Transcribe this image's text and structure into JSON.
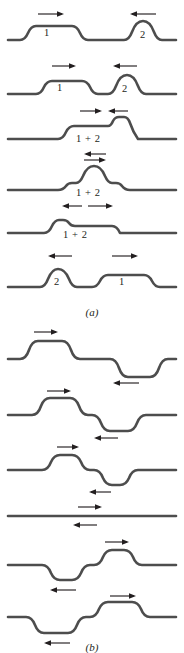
{
  "figure": {
    "panels": [
      {
        "id": "a",
        "label": "(a)",
        "caption_hint": "two upright pulses approaching, overlapping constructively, then separating",
        "rows": [
          {
            "name": "a-row-1",
            "labels": [
              {
                "text": "1",
                "x": 48,
                "y": 31
              },
              {
                "text": "2",
                "x": 143,
                "y": 33
              }
            ],
            "arrows": [
              {
                "name": "arrow-right-pulse-1",
                "dir": "right",
                "x": 38,
                "y": 14,
                "len": 26
              },
              {
                "name": "arrow-left-pulse-2",
                "dir": "left",
                "x": 130,
                "y": 14,
                "len": 26
              }
            ]
          },
          {
            "name": "a-row-2",
            "labels": [
              {
                "text": "1",
                "x": 60,
                "y": 85
              },
              {
                "text": "2",
                "x": 125,
                "y": 86
              }
            ],
            "arrows": [
              {
                "name": "arrow-right-pulse-1",
                "dir": "right",
                "x": 52,
                "y": 66,
                "len": 24
              },
              {
                "name": "arrow-left-pulse-2",
                "dir": "left",
                "x": 113,
                "y": 66,
                "len": 24
              }
            ]
          },
          {
            "name": "a-row-3",
            "labels": [
              {
                "text": "1 + 2",
                "x": 90,
                "y": 137
              }
            ],
            "arrows": [
              {
                "name": "arrow-right-pulse-1",
                "dir": "right",
                "x": 84,
                "y": 119,
                "len": 22
              },
              {
                "name": "arrow-left-pulse-2",
                "dir": "left",
                "x": 110,
                "y": 119,
                "len": 19
              }
            ]
          },
          {
            "name": "a-row-4",
            "labels": [
              {
                "text": "1 + 2",
                "x": 90,
                "y": 190
              }
            ],
            "arrows": [
              {
                "name": "arrow-left-pulse-2",
                "dir": "left",
                "x": 84,
                "y": 153,
                "len": 22
              },
              {
                "name": "arrow-right-pulse-1",
                "dir": "right",
                "x": 84,
                "y": 160,
                "len": 22
              }
            ]
          },
          {
            "name": "a-row-5",
            "labels": [
              {
                "text": "1 + 2",
                "x": 77,
                "y": 231
              }
            ],
            "arrows": [
              {
                "name": "arrow-left-pulse-2",
                "dir": "left",
                "x": 62,
                "y": 205,
                "len": 20
              },
              {
                "name": "arrow-right-pulse-1",
                "dir": "right",
                "x": 88,
                "y": 205,
                "len": 25
              }
            ]
          },
          {
            "name": "a-row-6",
            "labels": [
              {
                "text": "2",
                "x": 57,
                "y": 283
              },
              {
                "text": "1",
                "x": 122,
                "y": 283
              }
            ],
            "arrows": [
              {
                "name": "arrow-left-pulse-2",
                "dir": "left",
                "x": 48,
                "y": 256,
                "len": 24
              },
              {
                "name": "arrow-right-pulse-1",
                "dir": "right",
                "x": 112,
                "y": 256,
                "len": 26
              }
            ]
          }
        ]
      },
      {
        "id": "b",
        "label": "(b)",
        "caption_hint": "an upright pulse and an inverted pulse approaching, cancelling, then separating",
        "rows": [
          {
            "name": "b-row-1",
            "labels": [],
            "arrows": [
              {
                "name": "arrow-right-upright-pulse",
                "dir": "right",
                "x": 34,
                "y": 340,
                "len": 24
              },
              {
                "name": "arrow-left-inverted-pulse",
                "dir": "left",
                "x": 113,
                "y": 377,
                "len": 26
              }
            ]
          },
          {
            "name": "b-row-2",
            "labels": [],
            "arrows": [
              {
                "name": "arrow-right-upright-pulse",
                "dir": "right",
                "x": 47,
                "y": 392,
                "len": 24
              },
              {
                "name": "arrow-left-inverted-pulse",
                "dir": "left",
                "x": 94,
                "y": 428,
                "len": 24
              }
            ]
          },
          {
            "name": "b-row-3",
            "labels": [],
            "arrows": [
              {
                "name": "arrow-right-upright-pulse",
                "dir": "right",
                "x": 57,
                "y": 443,
                "len": 22
              },
              {
                "name": "arrow-left-inverted-pulse",
                "dir": "left",
                "x": 89,
                "y": 478,
                "len": 22
              }
            ]
          },
          {
            "name": "b-row-4",
            "labels": [],
            "arrows": [
              {
                "name": "arrow-right-upright-pulse",
                "dir": "right",
                "x": 78,
                "y": 495,
                "len": 24
              },
              {
                "name": "arrow-left-inverted-pulse",
                "dir": "left",
                "x": 73,
                "y": 513,
                "len": 24
              }
            ]
          },
          {
            "name": "b-row-5",
            "labels": [],
            "arrows": [
              {
                "name": "arrow-right-upright-pulse",
                "dir": "right",
                "x": 105,
                "y": 527,
                "len": 24
              },
              {
                "name": "arrow-left-inverted-pulse",
                "dir": "left",
                "x": 50,
                "y": 565,
                "len": 26
              }
            ]
          },
          {
            "name": "b-row-6",
            "labels": [],
            "arrows": [
              {
                "name": "arrow-right-upright-pulse",
                "dir": "right",
                "x": 110,
                "y": 578,
                "len": 26
              },
              {
                "name": "arrow-left-inverted-pulse",
                "dir": "left",
                "x": 44,
                "y": 617,
                "len": 26
              }
            ]
          }
        ]
      }
    ],
    "colors": {
      "wave_stroke": "#4d4d4d",
      "arrow_stroke": "#231f20",
      "background": "#ffffff",
      "text": "#231f20"
    }
  }
}
